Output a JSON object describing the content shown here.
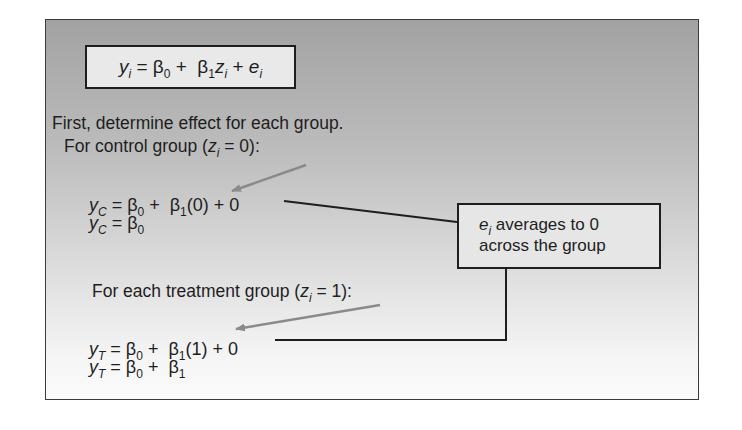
{
  "model_equation": {
    "y": "y",
    "y_sub": "i",
    "eq": " = ",
    "b0": "β",
    "b0_sub": "0",
    "plus1": " +  ",
    "b1": "β",
    "b1_sub": "1",
    "z": "z",
    "z_sub": "i",
    "plus2": " + ",
    "e": "e",
    "e_sub": "i"
  },
  "intro_text": "First, determine effect for each group.",
  "control": {
    "heading_prefix": "For control group (",
    "z": "z",
    "z_sub": "i",
    "cond": " = 0):",
    "line1": {
      "y": "y",
      "y_sub": "C",
      "rhs_a": " = β",
      "s0": "0",
      "rhs_b": " +  β",
      "s1": "1",
      "rhs_c": "(0) + 0"
    },
    "line2": {
      "y": "y",
      "y_sub": "C",
      "rhs_a": " = β",
      "s0": "0"
    }
  },
  "treatment": {
    "heading_prefix": "For each treatment group (",
    "z": "z",
    "z_sub": "i",
    "cond": " = 1):",
    "line1": {
      "y": "y",
      "y_sub": "T",
      "rhs_a": " = β",
      "s0": "0",
      "rhs_b": " +  β",
      "s1": "1",
      "rhs_c": "(1) + 0"
    },
    "line2": {
      "y": "y",
      "y_sub": "T",
      "rhs_a": " = β",
      "s0": "0",
      "rhs_b": " +  β",
      "s1": "1"
    }
  },
  "callout": {
    "e": "e",
    "e_sub": "i",
    "line1_rest": " averages to 0",
    "line2": "across the group"
  },
  "colors": {
    "frame_border": "#3a3a3a",
    "arrow": "#8a8a8a",
    "connector": "#1e1e1e"
  }
}
